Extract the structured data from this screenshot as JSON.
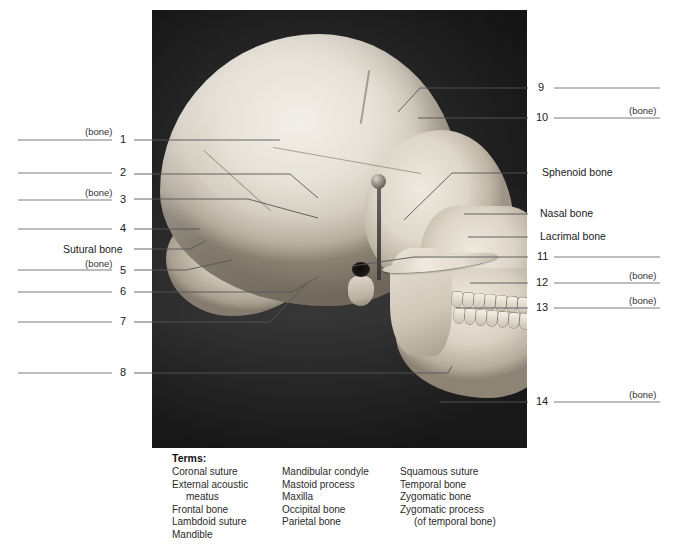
{
  "figure": {
    "photo_alt": "Black and white lateral (side) view photograph of a human skull on dark background"
  },
  "left_labels": [
    {
      "number": "1",
      "bone_tag": "(bone)",
      "named": ""
    },
    {
      "number": "2",
      "bone_tag": "",
      "named": ""
    },
    {
      "number": "3",
      "bone_tag": "(bone)",
      "named": ""
    },
    {
      "number": "4",
      "bone_tag": "",
      "named": ""
    },
    {
      "number": "",
      "bone_tag": "",
      "named": "Sutural bone"
    },
    {
      "number": "5",
      "bone_tag": "(bone)",
      "named": ""
    },
    {
      "number": "6",
      "bone_tag": "",
      "named": ""
    },
    {
      "number": "7",
      "bone_tag": "",
      "named": ""
    },
    {
      "number": "8",
      "bone_tag": "",
      "named": ""
    }
  ],
  "right_labels": [
    {
      "number": "9",
      "bone_tag": "",
      "named": ""
    },
    {
      "number": "10",
      "bone_tag": "(bone)",
      "named": ""
    },
    {
      "number": "",
      "bone_tag": "",
      "named": "Sphenoid bone"
    },
    {
      "number": "",
      "bone_tag": "",
      "named": "Nasal bone"
    },
    {
      "number": "",
      "bone_tag": "",
      "named": "Lacrimal bone"
    },
    {
      "number": "11",
      "bone_tag": "",
      "named": ""
    },
    {
      "number": "12",
      "bone_tag": "(bone)",
      "named": ""
    },
    {
      "number": "13",
      "bone_tag": "(bone)",
      "named": ""
    },
    {
      "number": "14",
      "bone_tag": "(bone)",
      "named": ""
    }
  ],
  "terms": {
    "title": "Terms:",
    "column1": [
      "Coronal suture",
      "External acoustic",
      "meatus",
      "Frontal bone",
      "Lambdoid suture",
      "Mandible"
    ],
    "column2": [
      "Mandibular condyle",
      "Mastoid process",
      "Maxilla",
      "Occipital bone",
      "Parietal bone"
    ],
    "column3": [
      "Squamous suture",
      "Temporal bone",
      "Zygomatic bone",
      "Zygomatic process",
      "(of temporal bone)"
    ]
  },
  "colors": {
    "page_background": "#ffffff",
    "photo_background": "#171717",
    "leader_line": "#5b5b5b",
    "answer_line": "#6e6e6e",
    "text": "#231f20"
  }
}
